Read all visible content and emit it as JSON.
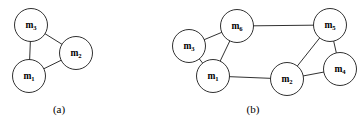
{
  "figure": {
    "width": 361,
    "height": 128,
    "background_color": "#ffffff",
    "stroke_color": "#1a1a1a",
    "label_color": "#000000",
    "node_fill": "#ffffff",
    "node_radius": 16
  },
  "panels": [
    {
      "id": "panel-a",
      "caption": "(a)",
      "caption_x": 59,
      "caption_y": 113,
      "nodes": [
        {
          "id": "a-m3",
          "base": "m",
          "sub": "3",
          "cx": 31,
          "cy": 25,
          "r": 16.5
        },
        {
          "id": "a-m2",
          "base": "m",
          "sub": "2",
          "cx": 76,
          "cy": 53,
          "r": 16.5
        },
        {
          "id": "a-m1",
          "base": "m",
          "sub": "1",
          "cx": 29,
          "cy": 76,
          "r": 16.5
        }
      ],
      "edges": [
        {
          "id": "a-e1",
          "from": "a-m3",
          "to": "a-m2"
        },
        {
          "id": "a-e2",
          "from": "a-m3",
          "to": "a-m1"
        },
        {
          "id": "a-e3",
          "from": "a-m1",
          "to": "a-m2"
        }
      ]
    },
    {
      "id": "panel-b",
      "caption": "(b)",
      "caption_x": 253,
      "caption_y": 113,
      "nodes": [
        {
          "id": "b-m6",
          "base": "m",
          "sub": "6",
          "cx": 237,
          "cy": 26,
          "r": 16.5
        },
        {
          "id": "b-m5",
          "base": "m",
          "sub": "5",
          "cx": 330,
          "cy": 25,
          "r": 16.5
        },
        {
          "id": "b-m3",
          "base": "m",
          "sub": "3",
          "cx": 189,
          "cy": 46,
          "r": 16.5
        },
        {
          "id": "b-m4",
          "base": "m",
          "sub": "4",
          "cx": 340,
          "cy": 69,
          "r": 16.5
        },
        {
          "id": "b-m1",
          "base": "m",
          "sub": "1",
          "cx": 213,
          "cy": 76,
          "r": 16.5
        },
        {
          "id": "b-m2",
          "base": "m",
          "sub": "2",
          "cx": 287,
          "cy": 79,
          "r": 16.5
        }
      ],
      "edges": [
        {
          "id": "b-e1",
          "from": "b-m3",
          "to": "b-m6"
        },
        {
          "id": "b-e2",
          "from": "b-m3",
          "to": "b-m1"
        },
        {
          "id": "b-e3",
          "from": "b-m6",
          "to": "b-m1"
        },
        {
          "id": "b-e4",
          "from": "b-m6",
          "to": "b-m5"
        },
        {
          "id": "b-e5",
          "from": "b-m1",
          "to": "b-m2"
        },
        {
          "id": "b-e6",
          "from": "b-m2",
          "to": "b-m5"
        },
        {
          "id": "b-e7",
          "from": "b-m2",
          "to": "b-m4"
        },
        {
          "id": "b-e8",
          "from": "b-m5",
          "to": "b-m4"
        }
      ]
    }
  ]
}
